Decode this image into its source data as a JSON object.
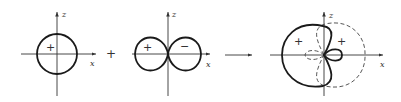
{
  "diagram": {
    "panels": [
      {
        "id": "s-orbital",
        "axes": {
          "horizontal": "x",
          "vertical": "z"
        },
        "lobes": [
          {
            "shape": "circle",
            "sign": "+"
          }
        ]
      },
      {
        "id": "p-orbital",
        "axes": {
          "horizontal": "x",
          "vertical": "z"
        },
        "lobes": [
          {
            "shape": "lobe-left",
            "sign": "+"
          },
          {
            "shape": "lobe-right",
            "sign": "−"
          }
        ]
      },
      {
        "id": "sp-hybrids",
        "axes": {
          "horizontal": "x",
          "vertical": "z"
        },
        "lobes": [
          {
            "shape": "large-lobe-left",
            "style": "solid",
            "sign": "+"
          },
          {
            "shape": "large-lobe-right",
            "style": "dashed",
            "sign": "+"
          }
        ]
      }
    ],
    "operators": {
      "plus": "+",
      "arrow": "→"
    },
    "labels": {
      "x": "x",
      "z": "z"
    },
    "signs": {
      "s": "+",
      "p_left": "+",
      "p_right": "−",
      "h1": "+",
      "h2": "+"
    }
  }
}
